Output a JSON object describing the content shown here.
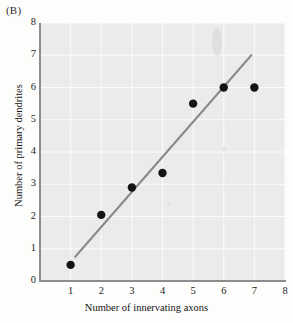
{
  "figure": {
    "panel_label": "(B)"
  },
  "chart_data": {
    "type": "scatter",
    "title": "",
    "xlabel": "Number of innervating axons",
    "ylabel": "Number of primary dendrites",
    "xlim": [
      0,
      8
    ],
    "ylim": [
      0,
      8
    ],
    "xticks": [
      1,
      2,
      3,
      4,
      5,
      6,
      7,
      8
    ],
    "yticks": [
      0,
      1,
      2,
      3,
      4,
      5,
      6,
      7,
      8
    ],
    "grid": true,
    "legend": "none",
    "x": [
      1,
      2,
      3,
      4,
      5,
      6,
      7
    ],
    "y": [
      0.5,
      2.05,
      2.9,
      3.35,
      5.5,
      6.0,
      6.0
    ],
    "points": [
      {
        "x": 1,
        "y": 0.5
      },
      {
        "x": 2,
        "y": 2.05
      },
      {
        "x": 3,
        "y": 2.9
      },
      {
        "x": 4,
        "y": 3.35
      },
      {
        "x": 5,
        "y": 5.5
      },
      {
        "x": 6,
        "y": 6.0
      },
      {
        "x": 7,
        "y": 6.0
      }
    ],
    "series": [
      {
        "name": "primary dendrites vs innervating axons",
        "type": "scatter",
        "marker": "filled-circle",
        "color": "#141414",
        "values": [
          0.5,
          2.05,
          2.9,
          3.35,
          5.5,
          6.0,
          6.0
        ]
      },
      {
        "name": "regression line",
        "type": "line",
        "color": "#8a8a8a",
        "x_start": 1.15,
        "y_start": 0.75,
        "x_end": 6.9,
        "y_end": 7.0
      }
    ],
    "colors": {
      "plot_background": "#ebebeb",
      "gridline": "#fbfbfb",
      "axis": "#8d8d8d",
      "marker": "#141414",
      "fit_line": "#8a8a8a"
    }
  }
}
